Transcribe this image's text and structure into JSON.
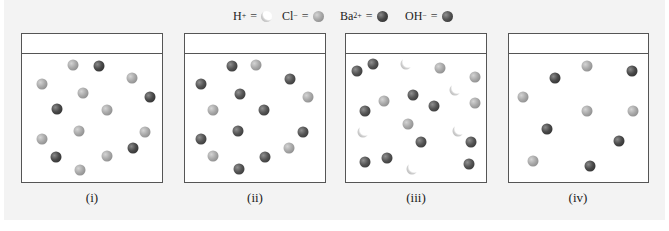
{
  "legend": [
    {
      "species": "H",
      "charge": "+",
      "symbol_type": "h",
      "left": 233
    },
    {
      "species": "Cl",
      "charge": "−",
      "symbol_type": "cl",
      "left": 282
    },
    {
      "species": "Ba",
      "charge": "2+",
      "symbol_type": "ba",
      "left": 340
    },
    {
      "species": "OH",
      "charge": "−",
      "symbol_type": "oh",
      "left": 405
    }
  ],
  "legend_equals": "=",
  "colors": {
    "panel_background": "#f3f3f3",
    "box_border": "#555555",
    "cl_ion": "#a9a9a9",
    "ba_ion": "#4a4a4a",
    "oh_ion": "#555555",
    "h_ion": "#ffffff"
  },
  "boxes": [
    {
      "label": "(i)",
      "left": 21,
      "width": 142,
      "ions": [
        {
          "type": "cl",
          "x": 73,
          "y": 65
        },
        {
          "type": "ba",
          "x": 99,
          "y": 66
        },
        {
          "type": "cl",
          "x": 132,
          "y": 78
        },
        {
          "type": "cl",
          "x": 42,
          "y": 84
        },
        {
          "type": "cl",
          "x": 83,
          "y": 93
        },
        {
          "type": "ba",
          "x": 150,
          "y": 97
        },
        {
          "type": "ba",
          "x": 57,
          "y": 109
        },
        {
          "type": "cl",
          "x": 107,
          "y": 110
        },
        {
          "type": "cl",
          "x": 79,
          "y": 131
        },
        {
          "type": "cl",
          "x": 145,
          "y": 132
        },
        {
          "type": "cl",
          "x": 42,
          "y": 139
        },
        {
          "type": "ba",
          "x": 133,
          "y": 148
        },
        {
          "type": "ba",
          "x": 56,
          "y": 157
        },
        {
          "type": "cl",
          "x": 107,
          "y": 156
        },
        {
          "type": "cl",
          "x": 80,
          "y": 170
        }
      ]
    },
    {
      "label": "(ii)",
      "left": 184,
      "width": 142,
      "ions": [
        {
          "type": "oh",
          "x": 232,
          "y": 66
        },
        {
          "type": "cl",
          "x": 256,
          "y": 65
        },
        {
          "type": "oh",
          "x": 201,
          "y": 84
        },
        {
          "type": "oh",
          "x": 290,
          "y": 79
        },
        {
          "type": "oh",
          "x": 240,
          "y": 94
        },
        {
          "type": "cl",
          "x": 308,
          "y": 97
        },
        {
          "type": "cl",
          "x": 213,
          "y": 110
        },
        {
          "type": "oh",
          "x": 264,
          "y": 110
        },
        {
          "type": "oh",
          "x": 238,
          "y": 131
        },
        {
          "type": "oh",
          "x": 303,
          "y": 132
        },
        {
          "type": "oh",
          "x": 201,
          "y": 139
        },
        {
          "type": "cl",
          "x": 289,
          "y": 148
        },
        {
          "type": "cl",
          "x": 213,
          "y": 156
        },
        {
          "type": "oh",
          "x": 265,
          "y": 157
        },
        {
          "type": "oh",
          "x": 239,
          "y": 169
        }
      ]
    },
    {
      "label": "(iii)",
      "left": 345,
      "width": 142,
      "ions": [
        {
          "type": "oh",
          "x": 357,
          "y": 71
        },
        {
          "type": "oh",
          "x": 373,
          "y": 64
        },
        {
          "type": "h",
          "x": 406,
          "y": 64
        },
        {
          "type": "cl",
          "x": 440,
          "y": 68
        },
        {
          "type": "cl",
          "x": 475,
          "y": 77
        },
        {
          "type": "h",
          "x": 455,
          "y": 90
        },
        {
          "type": "oh",
          "x": 413,
          "y": 95
        },
        {
          "type": "cl",
          "x": 384,
          "y": 101
        },
        {
          "type": "oh",
          "x": 434,
          "y": 106
        },
        {
          "type": "cl",
          "x": 475,
          "y": 103
        },
        {
          "type": "oh",
          "x": 365,
          "y": 111
        },
        {
          "type": "cl",
          "x": 408,
          "y": 124
        },
        {
          "type": "h",
          "x": 363,
          "y": 132
        },
        {
          "type": "h",
          "x": 458,
          "y": 131
        },
        {
          "type": "oh",
          "x": 421,
          "y": 142
        },
        {
          "type": "oh",
          "x": 471,
          "y": 142
        },
        {
          "type": "oh",
          "x": 365,
          "y": 162
        },
        {
          "type": "oh",
          "x": 387,
          "y": 158
        },
        {
          "type": "h",
          "x": 412,
          "y": 169
        },
        {
          "type": "oh",
          "x": 469,
          "y": 164
        }
      ]
    },
    {
      "label": "(iv)",
      "left": 508,
      "width": 141,
      "ions": [
        {
          "type": "cl",
          "x": 587,
          "y": 66
        },
        {
          "type": "ba",
          "x": 555,
          "y": 78
        },
        {
          "type": "ba",
          "x": 632,
          "y": 71
        },
        {
          "type": "cl",
          "x": 523,
          "y": 97
        },
        {
          "type": "cl",
          "x": 587,
          "y": 111
        },
        {
          "type": "cl",
          "x": 633,
          "y": 111
        },
        {
          "type": "ba",
          "x": 547,
          "y": 129
        },
        {
          "type": "ba",
          "x": 619,
          "y": 141
        },
        {
          "type": "cl",
          "x": 533,
          "y": 161
        },
        {
          "type": "ba",
          "x": 590,
          "y": 166
        }
      ]
    }
  ]
}
